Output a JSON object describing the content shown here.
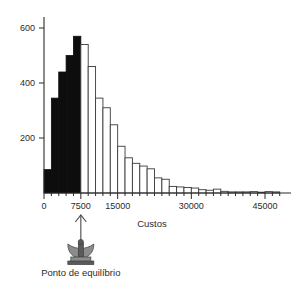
{
  "chart_data": {
    "type": "bar",
    "title": "",
    "xlabel": "Custos",
    "ylabel": "",
    "xlim": [
      0,
      49500
    ],
    "ylim": [
      0,
      640
    ],
    "grid": false,
    "legend": "none",
    "bin_width": 1500,
    "x_ticks": [
      {
        "value": 0,
        "label": "0"
      },
      {
        "value": 7500,
        "label": "7500"
      },
      {
        "value": 15000,
        "label": "15000"
      },
      {
        "value": 30000,
        "label": "30000"
      },
      {
        "value": 45000,
        "label": "45000"
      }
    ],
    "x_minor_ticks": [
      1500,
      3000,
      4500,
      6000,
      9000,
      10500,
      12000,
      13500,
      16500,
      18000,
      19500,
      21000,
      22500,
      24000,
      25500,
      27000,
      28500,
      31500,
      33000,
      34500,
      36000,
      37500,
      39000,
      40500,
      42000,
      43500,
      46500,
      48000
    ],
    "y_ticks": [
      {
        "value": 200,
        "label": "200"
      },
      {
        "value": 400,
        "label": "400"
      },
      {
        "value": 600,
        "label": "600"
      }
    ],
    "categories": [
      "0",
      "1500",
      "3000",
      "4500",
      "6000",
      "7500",
      "9000",
      "10500",
      "12000",
      "13500",
      "15000",
      "16500",
      "18000",
      "19500",
      "21000",
      "22500",
      "24000",
      "25500",
      "27000",
      "28500",
      "30000",
      "31500",
      "33000",
      "34500",
      "36000",
      "37500",
      "39000",
      "40500",
      "42000",
      "43500",
      "45000",
      "46500"
    ],
    "values": [
      85,
      345,
      440,
      500,
      570,
      540,
      460,
      345,
      310,
      248,
      170,
      128,
      108,
      98,
      88,
      55,
      50,
      24,
      22,
      20,
      18,
      12,
      10,
      14,
      6,
      4,
      4,
      4,
      5,
      3,
      5,
      4
    ],
    "bar_styles": [
      "filled",
      "filled",
      "filled",
      "filled",
      "filled",
      "open",
      "open",
      "open",
      "open",
      "open",
      "open",
      "open",
      "open",
      "open",
      "open",
      "open",
      "open",
      "open",
      "open",
      "open",
      "open",
      "open",
      "open",
      "open",
      "open",
      "open",
      "open",
      "open",
      "open",
      "open",
      "open",
      "open"
    ],
    "annotation": {
      "marker": "balance-scale-with-arrow",
      "at_x": 7500,
      "caption": "Ponto de equilíbrio"
    },
    "colors": {
      "filled_bar": "#0d0d0d",
      "open_bar_fill": "#ffffff",
      "open_bar_stroke": "#3a3a3a",
      "axis": "#2b2b2b",
      "text": "#2b2b2b"
    }
  },
  "annotation": {
    "caption": "Ponto de equilíbrio"
  },
  "axes": {
    "x_title": "Custos"
  }
}
